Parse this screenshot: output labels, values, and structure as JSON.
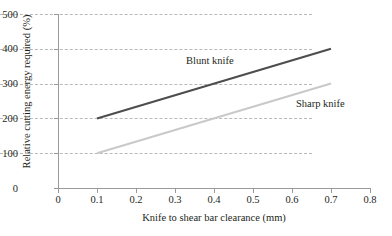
{
  "chart_data": {
    "type": "line",
    "title": "",
    "xlabel": "Knife to shear bar clearance (mm)",
    "ylabel": "Relative cutting energy required (%)",
    "xlim": [
      0,
      0.8
    ],
    "ylim": [
      0,
      500
    ],
    "xticks": [
      "0",
      "0.1",
      "0.2",
      "0.3",
      "0.4",
      "0.5",
      "0.6",
      "0.7",
      "0.8"
    ],
    "xtick_values": [
      0,
      0.1,
      0.2,
      0.3,
      0.4,
      0.5,
      0.6,
      0.7,
      0.8
    ],
    "yticks": [
      "0",
      "100",
      "200",
      "300",
      "400",
      "500"
    ],
    "ytick_values": [
      0,
      100,
      200,
      300,
      400,
      500
    ],
    "grid": "horizontal-dashed",
    "legend_position": "inline-annotations",
    "series": [
      {
        "name": "Blunt knife",
        "color": "#4d4d4d",
        "x": [
          0.1,
          0.7
        ],
        "values": [
          200,
          400
        ],
        "label_x": 0.33,
        "label_y": 355
      },
      {
        "name": "Sharp knife",
        "color": "#c9c9c9",
        "x": [
          0.1,
          0.7
        ],
        "values": [
          100,
          300
        ],
        "label_x": 0.61,
        "label_y": 233
      }
    ],
    "annotations": [
      {
        "text": "Blunt knife"
      },
      {
        "text": "Sharp knife"
      }
    ]
  },
  "axes": {
    "x_title": "Knife to shear bar clearance (mm)",
    "y_title": "Relative cutting energy required (%)",
    "x_ticks": [
      {
        "label": "0"
      },
      {
        "label": "0.1"
      },
      {
        "label": "0.2"
      },
      {
        "label": "0.3"
      },
      {
        "label": "0.4"
      },
      {
        "label": "0.5"
      },
      {
        "label": "0.6"
      },
      {
        "label": "0.7"
      },
      {
        "label": "0.8"
      }
    ],
    "y_ticks": [
      {
        "label": "500"
      },
      {
        "label": "400"
      },
      {
        "label": "300"
      },
      {
        "label": "200"
      },
      {
        "label": "100"
      },
      {
        "label": "0"
      }
    ]
  },
  "labels": {
    "blunt": "Blunt knife",
    "sharp": "Sharp knife"
  },
  "colors": {
    "blunt_line": "#4d4d4d",
    "sharp_line": "#c9c9c9",
    "gridline": "#b9b9b9",
    "axis": "#9a9a9a",
    "text": "#231f20",
    "background": "#ffffff"
  }
}
